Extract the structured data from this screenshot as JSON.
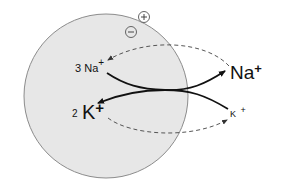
{
  "diagram": {
    "type": "sodium-potassium-pump",
    "cell": {
      "fill": "#e6e6e6",
      "stroke": "#8a8a8a"
    },
    "membrane_signs": {
      "outside": "+",
      "inside": "−"
    },
    "inside_labels": {
      "sodium": {
        "count": "3",
        "ion": "Na",
        "charge": "+"
      },
      "potassium": {
        "count": "2",
        "ion": "K",
        "charge": "+"
      }
    },
    "outside_labels": {
      "sodium": {
        "ion": "Na",
        "charge": "+"
      },
      "potassium": {
        "ion": "K",
        "charge": "+"
      }
    },
    "arrows": [
      {
        "from": "3 Na+ (inside)",
        "to": "Na+ (outside)",
        "style": "solid"
      },
      {
        "from": "K+ (outside)",
        "to": "2 K+ (inside)",
        "style": "solid"
      },
      {
        "from": "Na+ (outside)",
        "to": "3 Na+ (inside)",
        "style": "dashed"
      },
      {
        "from": "2 K+ (inside)",
        "to": "K+ (outside)",
        "style": "dashed"
      }
    ]
  }
}
